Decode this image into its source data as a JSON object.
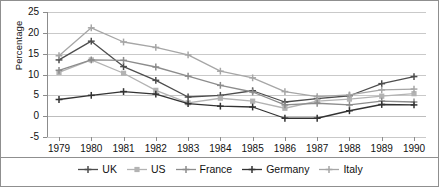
{
  "chart_data": {
    "type": "line",
    "title": "",
    "xlabel": "",
    "ylabel": "Percentage",
    "categories": [
      "1979",
      "1980",
      "1981",
      "1982",
      "1983",
      "1984",
      "1985",
      "1986",
      "1987",
      "1988",
      "1989",
      "1990"
    ],
    "ylim": [
      -5,
      25
    ],
    "yticks": [
      -5,
      0,
      5,
      10,
      15,
      20,
      25
    ],
    "grid": true,
    "legend_position": "bottom",
    "series": [
      {
        "name": "UK",
        "color": "#4d4d4d",
        "marker": "plus",
        "values": [
          13.5,
          18.0,
          11.9,
          8.6,
          4.6,
          5.0,
          6.1,
          3.4,
          4.2,
          4.9,
          7.8,
          9.5
        ]
      },
      {
        "name": "US",
        "color": "#b3b3b3",
        "marker": "square",
        "values": [
          10.5,
          13.5,
          10.3,
          6.2,
          3.2,
          4.3,
          3.6,
          1.9,
          3.6,
          4.1,
          4.8,
          5.4
        ]
      },
      {
        "name": "France",
        "color": "#8c8c8c",
        "marker": "plus",
        "values": [
          11.0,
          13.5,
          13.4,
          11.8,
          9.6,
          7.4,
          5.8,
          2.7,
          3.1,
          2.7,
          3.6,
          3.4
        ]
      },
      {
        "name": "Germany",
        "color": "#333333",
        "marker": "plus",
        "values": [
          4.0,
          5.0,
          5.9,
          5.3,
          3.0,
          2.4,
          2.2,
          -0.5,
          -0.5,
          1.3,
          2.8,
          2.7
        ]
      },
      {
        "name": "Italy",
        "color": "#a6a6a6",
        "marker": "plus",
        "values": [
          14.5,
          21.2,
          17.8,
          16.5,
          14.7,
          10.8,
          9.2,
          5.9,
          4.7,
          5.1,
          6.3,
          6.5
        ]
      }
    ]
  },
  "axis": {
    "y_title": "Percentage",
    "y_ticks": [
      "25",
      "20",
      "15",
      "10",
      "5",
      "0",
      "-5"
    ],
    "x_ticks": [
      "1979",
      "1980",
      "1981",
      "1982",
      "1983",
      "1984",
      "1985",
      "1986",
      "1987",
      "1988",
      "1989",
      "1990"
    ]
  },
  "legend": {
    "items": [
      {
        "label": "UK"
      },
      {
        "label": "US"
      },
      {
        "label": "France"
      },
      {
        "label": "Germany"
      },
      {
        "label": "Italy"
      }
    ]
  }
}
